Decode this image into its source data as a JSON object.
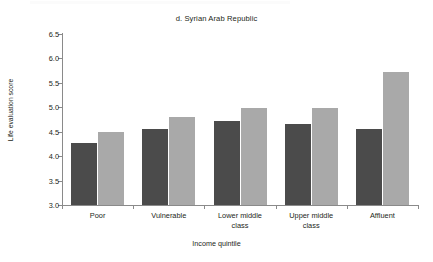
{
  "chart_data": {
    "type": "bar",
    "title": "d. Syrian Arab Republic",
    "xlabel": "Income quintile",
    "ylabel": "Life evaluation score",
    "ylim": [
      3.0,
      6.5
    ],
    "ytick_labels": [
      "3.0",
      "3.5",
      "4.0",
      "4.5",
      "5.0",
      "5.5",
      "6.0",
      "6.5"
    ],
    "ytick_values": [
      3.0,
      3.5,
      4.0,
      4.5,
      5.0,
      5.5,
      6.0,
      6.5
    ],
    "grid": false,
    "legend": "none",
    "categories": [
      "Poor",
      "Vulnerable",
      "Lower middle class",
      "Upper middle class",
      "Affluent"
    ],
    "series": [
      {
        "name": "series-1",
        "color": "#4b4b4b",
        "values": [
          4.27,
          4.55,
          4.71,
          4.65,
          4.55
        ]
      },
      {
        "name": "series-2",
        "color": "#a9a9a9",
        "values": [
          4.49,
          4.81,
          4.99,
          4.98,
          5.73
        ]
      }
    ]
  }
}
